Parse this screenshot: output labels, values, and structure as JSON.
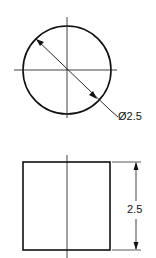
{
  "drawing": {
    "type": "orthographic-views",
    "top_view": {
      "shape": "circle",
      "diameter_label": "Ø2.5"
    },
    "front_view": {
      "shape": "rectangle",
      "height_label": "2.5"
    },
    "colors": {
      "line": "#111111",
      "background": "#ffffff"
    }
  }
}
